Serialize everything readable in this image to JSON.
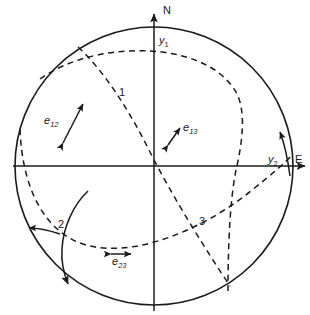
{
  "figure": {
    "type": "stereographic-projection",
    "background_color": "#ffffff",
    "line_color": "#1a1a1a"
  },
  "geometry": {
    "center_x": 154,
    "center_y": 166,
    "radius": 139
  },
  "axes": {
    "north": {
      "label": "N",
      "label_x": 163,
      "label_y": 14
    },
    "east": {
      "label": "E",
      "label_x": 295,
      "label_y": 163
    },
    "y1": {
      "label": "y",
      "subscript": "1",
      "label_x": 159,
      "label_y": 44
    },
    "y2": {
      "label": "y",
      "subscript": "2",
      "label_x": 268,
      "label_y": 163
    }
  },
  "intersection_points": [
    {
      "id": "p1",
      "label": "1",
      "x": 119,
      "y": 96
    },
    {
      "id": "p2",
      "label": "2",
      "x": 58,
      "y": 228
    },
    {
      "id": "p3",
      "label": "3",
      "x": 199,
      "y": 225
    }
  ],
  "lineation_vectors": [
    {
      "id": "e12",
      "label": "e",
      "subscript": "12",
      "label_x": 44,
      "label_y": 124,
      "arrow_type": "double-headed",
      "orientation": "diagonal-ne-sw"
    },
    {
      "id": "e13",
      "label": "e",
      "subscript": "13",
      "label_x": 183,
      "label_y": 131,
      "arrow_type": "double-headed",
      "orientation": "diagonal-short-ne-sw"
    },
    {
      "id": "e23",
      "label": "e",
      "subscript": "23",
      "label_x": 112,
      "label_y": 265,
      "arrow_type": "double-headed",
      "orientation": "horizontal"
    }
  ],
  "great_circles": [
    {
      "id": "gc-1",
      "style": "dashed",
      "note": "plane 1 - arc from upper-left rim sweeping down through centre to lower-right rim"
    },
    {
      "id": "gc-2",
      "style": "dashed",
      "note": "plane 2 - arc from left rim through lower-centre to right rim"
    },
    {
      "id": "gc-3",
      "style": "dashed",
      "note": "plane 3 - arc from upper-centre sweeping right and down to lower-left rim"
    }
  ],
  "slip_arcs": [
    {
      "id": "slip-left",
      "style": "solid",
      "note": "curved arrow near point 2 on the left"
    },
    {
      "id": "slip-right",
      "style": "solid",
      "note": "curved arrow near y2 on the right"
    }
  ]
}
